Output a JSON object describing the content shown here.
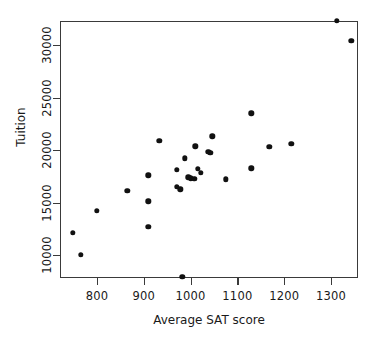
{
  "chart_data": {
    "type": "scatter",
    "title": "",
    "xlabel": "Average SAT score",
    "ylabel": "Tuition",
    "xlim": [
      735,
      1355
    ],
    "ylim": [
      7000,
      33500
    ],
    "xticks": [
      800,
      900,
      1000,
      1100,
      1200,
      1300
    ],
    "xticklabels": [
      "800",
      "900",
      "1000",
      "1100",
      "1200",
      "1300"
    ],
    "yticks": [
      10000,
      15000,
      20000,
      25000,
      30000
    ],
    "yticklabels": [
      "10000",
      "15000",
      "20000",
      "25000",
      "30000"
    ],
    "grid": false,
    "legend": null,
    "marker": "filled-circle",
    "marker_color": "#111111",
    "frame_color": "#3a3a3a",
    "background": "#ffffff",
    "n_points": 31,
    "points": [
      {
        "x": 748,
        "y": 12100
      },
      {
        "x": 765,
        "y": 10000
      },
      {
        "x": 800,
        "y": 14200
      },
      {
        "x": 865,
        "y": 16100
      },
      {
        "x": 910,
        "y": 17600
      },
      {
        "x": 910,
        "y": 15100
      },
      {
        "x": 910,
        "y": 12700
      },
      {
        "x": 933,
        "y": 20900
      },
      {
        "x": 970,
        "y": 18100
      },
      {
        "x": 970,
        "y": 16500
      },
      {
        "x": 978,
        "y": 16250
      },
      {
        "x": 982,
        "y": 7900
      },
      {
        "x": 988,
        "y": 19200
      },
      {
        "x": 995,
        "y": 17400
      },
      {
        "x": 1000,
        "y": 17300
      },
      {
        "x": 1008,
        "y": 17250
      },
      {
        "x": 1010,
        "y": 20350
      },
      {
        "x": 1016,
        "y": 18200
      },
      {
        "x": 1022,
        "y": 17800
      },
      {
        "x": 1038,
        "y": 19850
      },
      {
        "x": 1042,
        "y": 19750
      },
      {
        "x": 1046,
        "y": 21300
      },
      {
        "x": 1075,
        "y": 17200
      },
      {
        "x": 1130,
        "y": 23500
      },
      {
        "x": 1130,
        "y": 18250
      },
      {
        "x": 1168,
        "y": 20300
      },
      {
        "x": 1215,
        "y": 20600
      },
      {
        "x": 1312,
        "y": 32300
      },
      {
        "x": 1343,
        "y": 30400
      }
    ]
  },
  "axes": {
    "x_label": "Average SAT score",
    "y_label": "Tuition"
  }
}
